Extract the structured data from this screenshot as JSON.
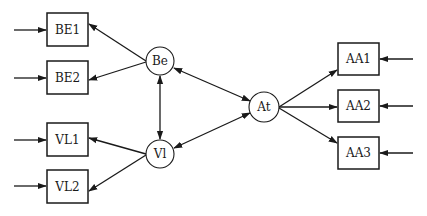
{
  "diagram": {
    "left_boxes": [
      {
        "id": "BE1",
        "label": "BE1"
      },
      {
        "id": "BE2",
        "label": "BE2"
      },
      {
        "id": "VL1",
        "label": "VL1"
      },
      {
        "id": "VL2",
        "label": "VL2"
      }
    ],
    "circles": [
      {
        "id": "Be",
        "label": "Be"
      },
      {
        "id": "Vl",
        "label": "Vl"
      },
      {
        "id": "At",
        "label": "At"
      }
    ],
    "right_boxes": [
      {
        "id": "AA1",
        "label": "AA1"
      },
      {
        "id": "AA2",
        "label": "AA2"
      },
      {
        "id": "AA3",
        "label": "AA3"
      }
    ],
    "edges": [
      {
        "from": "input",
        "to": "BE1"
      },
      {
        "from": "input",
        "to": "BE2"
      },
      {
        "from": "input",
        "to": "VL1"
      },
      {
        "from": "input",
        "to": "VL2"
      },
      {
        "from": "input",
        "to": "AA1"
      },
      {
        "from": "input",
        "to": "AA2"
      },
      {
        "from": "input",
        "to": "AA3"
      },
      {
        "from": "Be",
        "to": "BE1"
      },
      {
        "from": "Be",
        "to": "BE2"
      },
      {
        "from": "Vl",
        "to": "VL1"
      },
      {
        "from": "Vl",
        "to": "VL2"
      },
      {
        "from": "Be",
        "to": "Vl",
        "bidirectional": true
      },
      {
        "from": "Be",
        "to": "At",
        "bidirectional": true
      },
      {
        "from": "Vl",
        "to": "At",
        "bidirectional": true
      },
      {
        "from": "At",
        "to": "AA1"
      },
      {
        "from": "At",
        "to": "AA2"
      },
      {
        "from": "At",
        "to": "AA3"
      }
    ]
  }
}
